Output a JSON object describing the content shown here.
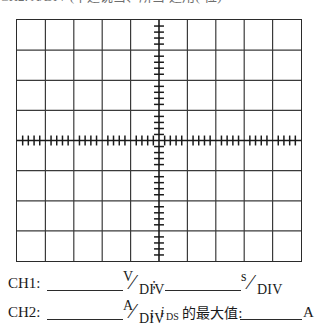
{
  "header": {
    "clipped_text": "CH2:    A/DIV (不适说当、所当-适用(-位)"
  },
  "scope": {
    "name": "oscilloscope-graticule",
    "columns": 10,
    "rows": 8,
    "border_color": "#2b2b2b",
    "grid_color": "#3a3a3a",
    "background": "#ffffff",
    "center_axis_ticks_per_division": 5,
    "tick_color": "#1a1a1a"
  },
  "annotations": {
    "ch1": {
      "label": "CH1:",
      "volts_numerator": "V",
      "volts_slash": "⁄",
      "volts_denominator": "DIV",
      "separator": ";",
      "time_numerator": "s",
      "time_slash": "⁄",
      "time_denominator": "DIV"
    },
    "ch2": {
      "label": "CH2:",
      "amps_numerator": "A",
      "amps_slash": "⁄",
      "amps_denominator": "DIV",
      "separator": ";",
      "current_symbol": "i",
      "current_subscript": "DS",
      "question_text": "的最大值:",
      "answer_unit": "A"
    }
  }
}
